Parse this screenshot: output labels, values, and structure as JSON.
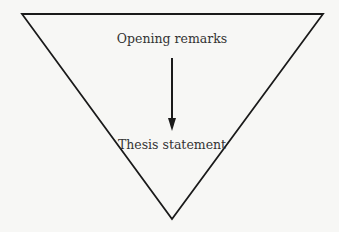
{
  "diagram": {
    "type": "inverted-triangle",
    "top_label": "Opening remarks",
    "bottom_label": "Thesis statement",
    "arrow_direction": "down",
    "stroke_color": "#1a1a1a",
    "background": "#f7f7f5"
  }
}
